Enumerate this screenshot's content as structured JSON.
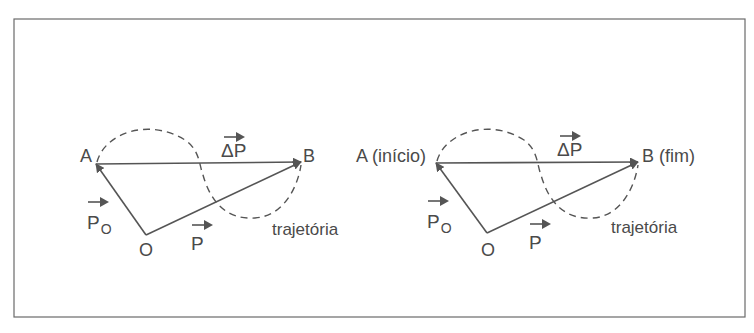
{
  "figure": {
    "frame": {
      "x": 14,
      "y": 19,
      "width": 731,
      "height": 298,
      "stroke": "#6a6a6a"
    },
    "colors": {
      "line": "#555555",
      "text": "#4a4a4a",
      "background": "#ffffff"
    },
    "panels": [
      {
        "id": "left",
        "points": {
          "A": {
            "x": 96,
            "y": 164,
            "label": "A",
            "label_x": 80,
            "label_y": 162
          },
          "B": {
            "x": 301,
            "y": 162,
            "label": "B",
            "label_x": 303,
            "label_y": 162
          },
          "O": {
            "x": 146,
            "y": 235,
            "label": "O",
            "label_x": 139,
            "label_y": 256
          }
        },
        "vectors": [
          {
            "name": "position-initial",
            "from": "O",
            "to": "A",
            "label": "P",
            "subscript": "O",
            "label_x": 87,
            "label_y": 229,
            "arrow_x": 88,
            "arrow_y": 202
          },
          {
            "name": "position-final",
            "from": "O",
            "to": "B",
            "label": "P",
            "subscript": "",
            "label_x": 191,
            "label_y": 250,
            "arrow_x": 192,
            "arrow_y": 225
          },
          {
            "name": "displacement",
            "from": "A",
            "to": "B",
            "label": "ΔP",
            "subscript": "",
            "label_x": 221,
            "label_y": 157,
            "arrow_x": 224,
            "arrow_y": 137
          }
        ],
        "trajectory": {
          "label": "trajetória",
          "label_x": 272,
          "label_y": 235,
          "path": "M 97 162 C 105 132, 150 118, 185 140 C 200 150, 199 165, 203 175 C 210 200, 225 220, 255 218 C 285 216, 298 185, 301 165"
        }
      },
      {
        "id": "right",
        "points": {
          "A": {
            "x": 436,
            "y": 163,
            "label": "A (início)",
            "label_x": 356,
            "label_y": 162
          },
          "B": {
            "x": 638,
            "y": 162,
            "label": "B (fim)",
            "label_x": 642,
            "label_y": 162
          },
          "O": {
            "x": 487,
            "y": 233,
            "label": "O",
            "label_x": 481,
            "label_y": 256
          }
        },
        "vectors": [
          {
            "name": "position-initial",
            "from": "O",
            "to": "A",
            "label": "P",
            "subscript": "O",
            "label_x": 427,
            "label_y": 228,
            "arrow_x": 428,
            "arrow_y": 201
          },
          {
            "name": "position-final",
            "from": "O",
            "to": "B",
            "label": "P",
            "subscript": "",
            "label_x": 529,
            "label_y": 249,
            "arrow_x": 530,
            "arrow_y": 224
          },
          {
            "name": "displacement",
            "from": "A",
            "to": "B",
            "label": "ΔP",
            "subscript": "",
            "label_x": 557,
            "label_y": 156,
            "arrow_x": 560,
            "arrow_y": 136
          }
        ],
        "trajectory": {
          "label": "trajetória",
          "label_x": 611,
          "label_y": 233,
          "path": "M 437 161 C 445 132, 490 118, 524 140 C 538 150, 537 165, 541 175 C 548 200, 563 220, 593 218 C 622 216, 635 185, 638 165"
        }
      }
    ]
  }
}
